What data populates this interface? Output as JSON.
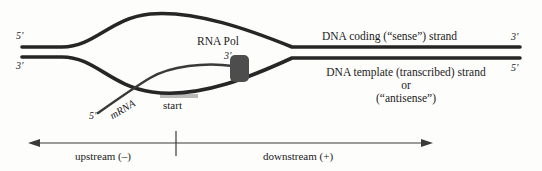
{
  "diagram": {
    "title_hidden": "DNA transcription bubble with RNA polymerase",
    "colors": {
      "strand": "#262626",
      "polymerase": "#4d4d4d",
      "text": "#1b1b1b",
      "axis": "#3a3a3a",
      "start_highlight": "#b9b9b9",
      "background": "#fdfdfc"
    },
    "left_ends": {
      "top": "5'",
      "bottom": "3'"
    },
    "right_ends": {
      "top": "3'",
      "bottom": "5'"
    },
    "polymerase": {
      "label": "RNA Pol",
      "rna_three_prime": "3'"
    },
    "mrna": {
      "label": "mRNA",
      "five_prime": "5'"
    },
    "start_site": {
      "label": "start"
    },
    "coding_strand": {
      "label": "DNA coding (“sense”) strand"
    },
    "template_strand": {
      "line1": "DNA template (transcribed) strand",
      "line2": "or",
      "line3": "(“antisense”)"
    },
    "axis": {
      "upstream": "upstream (–)",
      "downstream": "downstream (+)"
    }
  }
}
